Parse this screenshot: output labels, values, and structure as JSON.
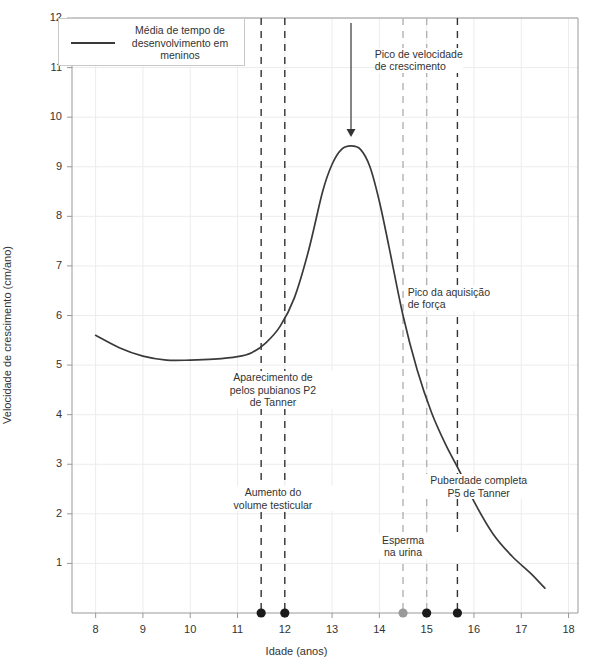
{
  "chart_data": {
    "type": "line",
    "title": "",
    "xlabel": "Idade (anos)",
    "ylabel": "Velocidade de crescimento (cm/ano)",
    "xlim": [
      7.5,
      18.2
    ],
    "ylim": [
      0,
      12
    ],
    "xticks": [
      8,
      9,
      10,
      11,
      12,
      13,
      14,
      15,
      16,
      17,
      18
    ],
    "yticks": [
      1,
      2,
      3,
      4,
      5,
      6,
      7,
      8,
      9,
      10,
      11,
      12
    ],
    "grid": true,
    "legend": {
      "position": "top-left",
      "entries": [
        {
          "label": "Média de tempo de\ndesenvolvimento em\nmeninos",
          "color": "#3a3a3a",
          "style": "solid-line"
        }
      ]
    },
    "series": [
      {
        "name": "Média de tempo de desenvolvimento em meninos",
        "color": "#3a3a3a",
        "x": [
          8.0,
          8.5,
          9.0,
          9.5,
          10.0,
          10.5,
          11.0,
          11.3,
          11.6,
          11.9,
          12.2,
          12.5,
          12.8,
          13.0,
          13.2,
          13.4,
          13.6,
          13.8,
          14.0,
          14.2,
          14.5,
          14.8,
          15.1,
          15.4,
          15.7,
          16.0,
          16.4,
          16.8,
          17.2,
          17.5
        ],
        "y": [
          5.6,
          5.35,
          5.18,
          5.1,
          5.1,
          5.12,
          5.17,
          5.25,
          5.45,
          5.78,
          6.35,
          7.3,
          8.5,
          9.05,
          9.35,
          9.42,
          9.35,
          9.0,
          8.3,
          7.4,
          6.0,
          4.9,
          4.05,
          3.4,
          2.85,
          2.25,
          1.6,
          1.15,
          0.8,
          0.5
        ]
      }
    ],
    "vertical_markers": [
      {
        "x": 11.5,
        "color": "#333333",
        "style": "dashed",
        "dot": "black"
      },
      {
        "x": 12.0,
        "color": "#333333",
        "style": "dashed",
        "dot": "black"
      },
      {
        "x": 14.5,
        "color": "#b3b3b3",
        "style": "dashed",
        "dot": "gray"
      },
      {
        "x": 15.0,
        "color": "#b3b3b3",
        "style": "dashed",
        "dot": "black"
      },
      {
        "x": 15.65,
        "color": "#333333",
        "style": "dashed",
        "dot": "black"
      }
    ],
    "annotations": [
      {
        "id": "peak",
        "text": "Pico de velocidade\nde crescimento",
        "x": 13.9,
        "y": 11.15,
        "align": "left",
        "arrow": {
          "from_x": 13.4,
          "from_y": 11.9,
          "to_x": 13.4,
          "to_y": 9.6
        }
      },
      {
        "id": "strength-peak",
        "text": "Pico da aquisição\nde força",
        "x": 14.6,
        "y": 6.35,
        "align": "left"
      },
      {
        "id": "pubic-hair",
        "text": "Aparecimento de\npelos pubianos P2\nde Tanner",
        "x": 11.75,
        "y": 4.5,
        "align": "center"
      },
      {
        "id": "testicular-volume",
        "text": "Aumento do\nvolume testicular",
        "x": 11.75,
        "y": 2.3,
        "align": "center"
      },
      {
        "id": "sperm-urine",
        "text": "Esperma\nna urina",
        "x": 14.5,
        "y": 1.35,
        "align": "center"
      },
      {
        "id": "complete-puberty",
        "text": "Puberdade completa\nP5 de Tanner",
        "x": 16.1,
        "y": 2.55,
        "align": "center"
      }
    ]
  },
  "axes": {
    "x_title": "Idade (anos)",
    "y_title": "Velocidade de crescimento (cm/ano)",
    "x_tick_labels": [
      "8",
      "9",
      "10",
      "11",
      "12",
      "13",
      "14",
      "15",
      "16",
      "17",
      "18"
    ],
    "y_tick_labels": [
      "1",
      "2",
      "3",
      "4",
      "5",
      "6",
      "7",
      "8",
      "9",
      "10",
      "11",
      "12"
    ]
  },
  "legend": {
    "label": "Média de tempo de desenvolvimento em meninos"
  },
  "annotations": {
    "peak": "Pico de velocidade\nde crescimento",
    "strength": "Pico da aquisição\nde força",
    "pubic_hair": "Aparecimento de\npelos pubianos P2\nde Tanner",
    "testicular": "Aumento do\nvolume testicular",
    "sperm": "Esperma\nna urina",
    "puberty": "Puberdade completa\nP5 de Tanner"
  },
  "colors": {
    "curve": "#3a3a3a",
    "grid": "#ececec",
    "axis": "#999999",
    "marker_dark": "#333333",
    "marker_light": "#b3b3b3",
    "dot_black": "#1a1a1a",
    "dot_gray": "#9a9a9a"
  }
}
